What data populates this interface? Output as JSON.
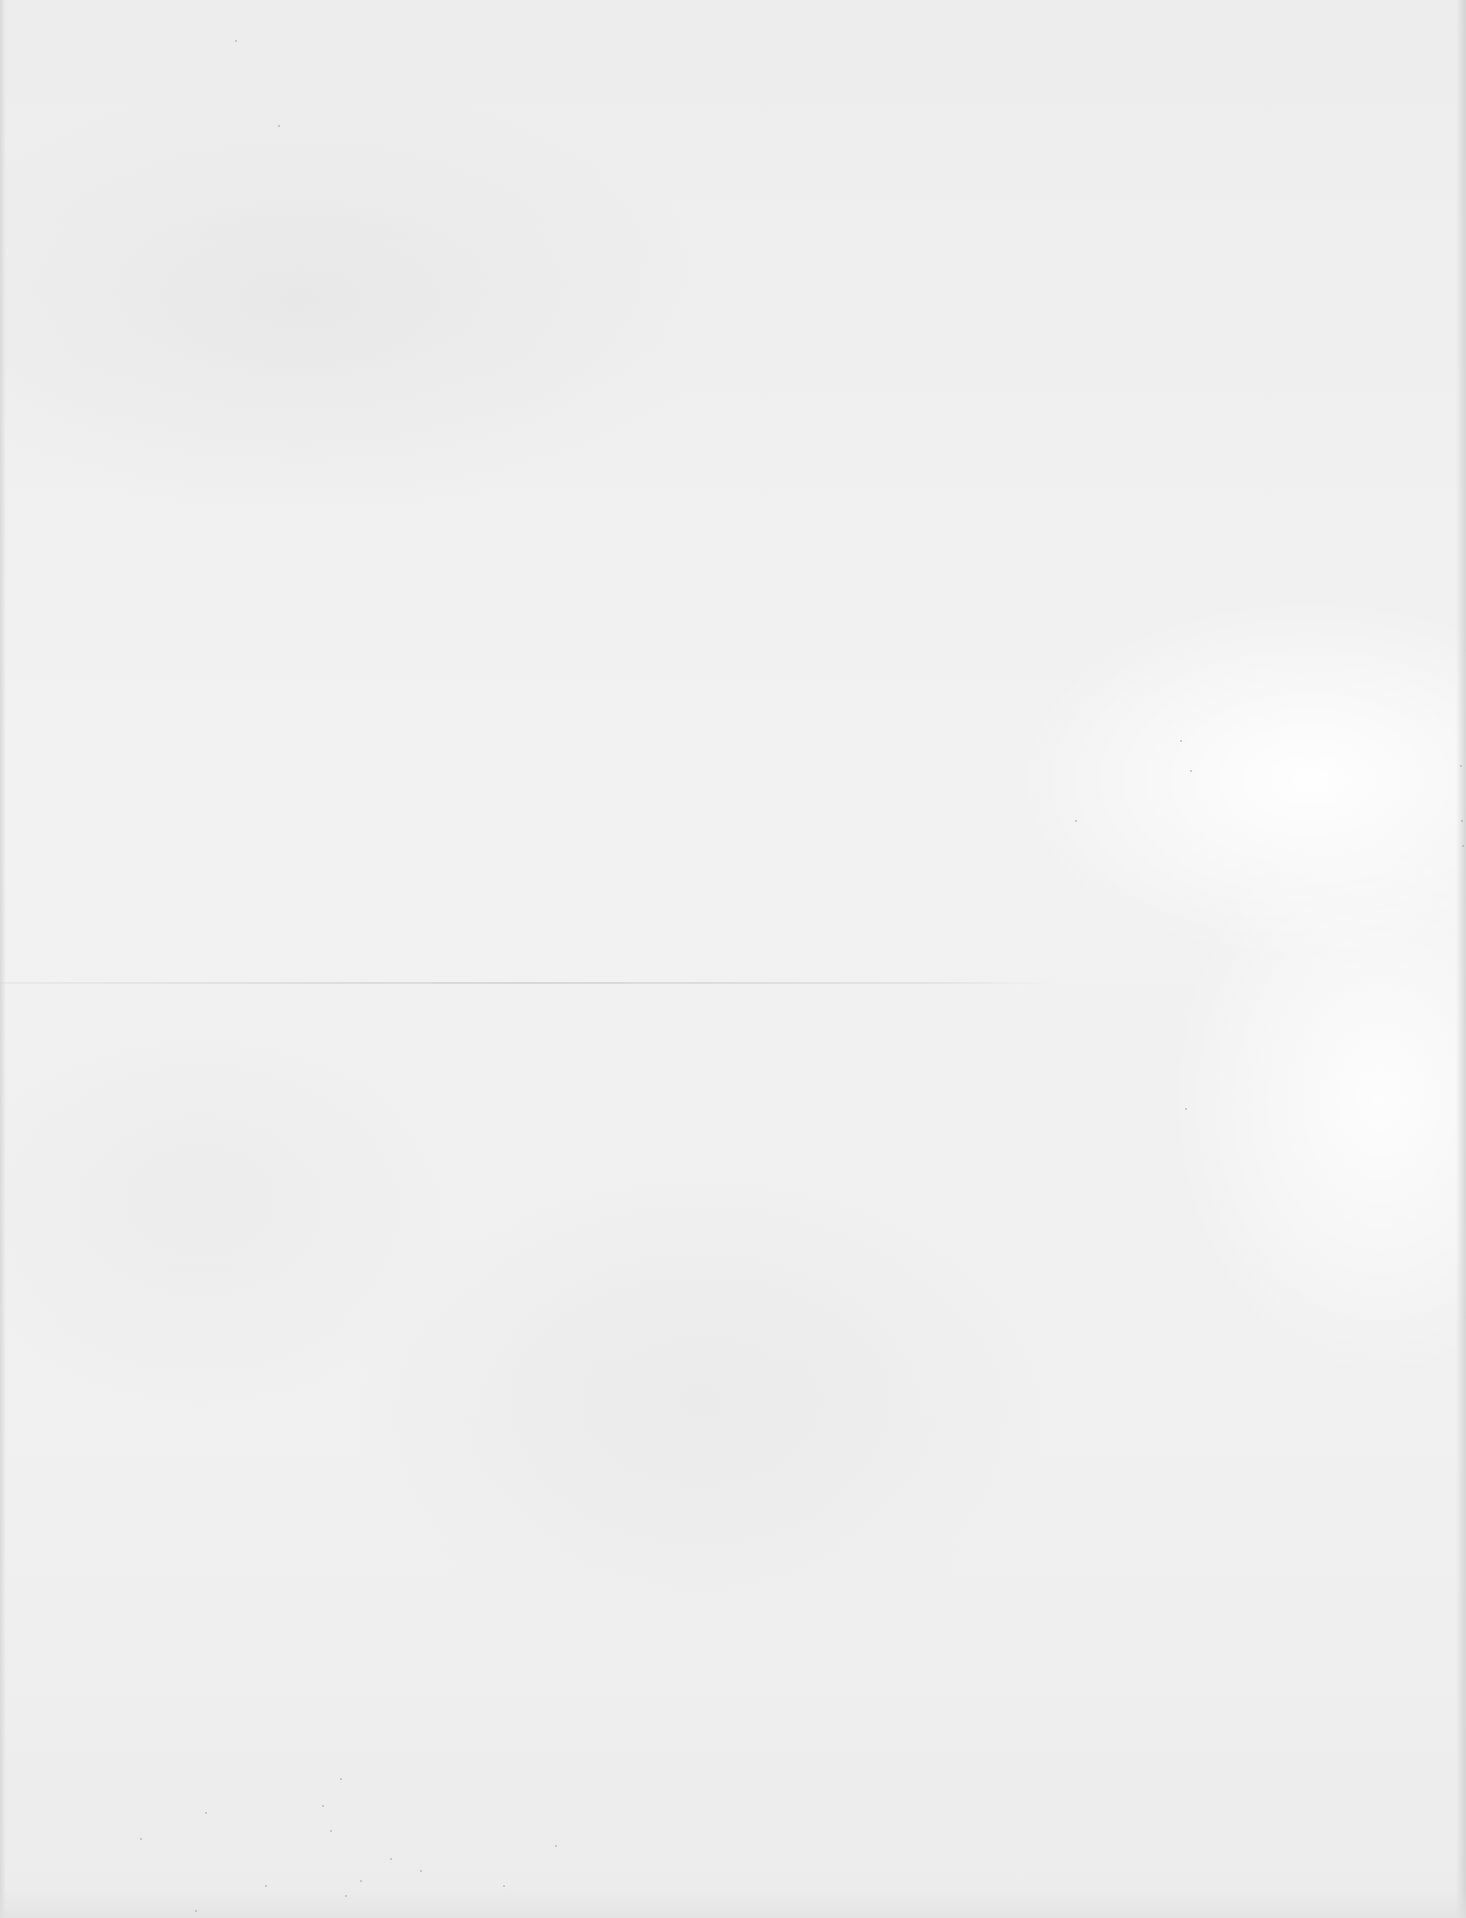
{
  "document": {
    "type": "blank scanned page",
    "text": ""
  },
  "colors": {
    "paper": "#efefef",
    "paper_light": "#fafafa",
    "crease": "#cdcdcd",
    "speckle": "#969696"
  }
}
